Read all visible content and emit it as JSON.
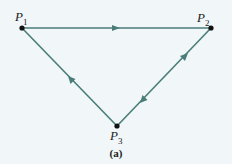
{
  "diagram": {
    "nodes": [
      {
        "id": "P1",
        "label": "P",
        "sub": "1",
        "x": 22,
        "y": 28
      },
      {
        "id": "P2",
        "label": "P",
        "sub": "2",
        "x": 211,
        "y": 28
      },
      {
        "id": "P3",
        "label": "P",
        "sub": "3",
        "x": 117,
        "y": 126
      }
    ],
    "edges": [
      {
        "from": "P1",
        "to": "P2",
        "arrows": [
          "forward"
        ]
      },
      {
        "from": "P3",
        "to": "P1",
        "arrows": [
          "forward"
        ]
      },
      {
        "from": "P2",
        "to": "P3",
        "arrows": [
          "both-directions"
        ]
      }
    ],
    "caption": "(a)",
    "colors": {
      "line": "#4a7d78",
      "node": "#111111",
      "background": "#f1f7f9"
    }
  }
}
